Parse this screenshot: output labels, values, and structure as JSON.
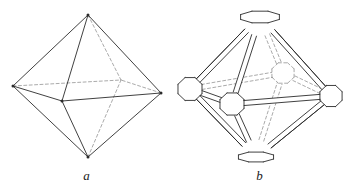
{
  "plate": {
    "background_color": "#ffffff",
    "width": 346,
    "height": 196,
    "subject": "crystal form drawings: octahedron and truncated octahedron"
  },
  "style": {
    "solid_edge_color": "#2b2b2b",
    "hidden_edge_color": "#8d8d8d",
    "face_color": "#ffffff",
    "caption_color": "#1a1a1a"
  },
  "figures": [
    {
      "id": "a",
      "caption": "a",
      "name": "octahedron",
      "description": "simple octahedron wireframe with hidden edges dashed",
      "vertices": {
        "top": [
          88,
          15
        ],
        "bottom": [
          88,
          157
        ],
        "left": [
          13,
          86
        ],
        "right": [
          161,
          93
        ],
        "front": [
          62,
          101
        ],
        "back": [
          121,
          80
        ]
      },
      "solid_edges": [
        [
          "top",
          "left"
        ],
        [
          "top",
          "right"
        ],
        [
          "top",
          "front"
        ],
        [
          "bottom",
          "left"
        ],
        [
          "bottom",
          "right"
        ],
        [
          "bottom",
          "front"
        ],
        [
          "left",
          "front"
        ],
        [
          "right",
          "front"
        ]
      ],
      "hidden_edges": [
        [
          "top",
          "back"
        ],
        [
          "bottom",
          "back"
        ],
        [
          "left",
          "back"
        ],
        [
          "right",
          "back"
        ]
      ],
      "vertex_dots": [
        "top",
        "bottom",
        "left",
        "right",
        "front"
      ]
    },
    {
      "id": "b",
      "caption": "b",
      "name": "truncated octahedron with bevelled edges",
      "description": "octahedron with each vertex replaced by a small octagonal face and each edge bevelled into a narrow strip",
      "poles": {
        "top": [
          260,
          17
        ],
        "bottom": [
          256,
          157
        ],
        "left": [
          190,
          89
        ],
        "right": [
          331,
          96
        ],
        "front": [
          232,
          104
        ],
        "back": [
          283,
          73
        ]
      },
      "octagon_radii": {
        "top": 21,
        "bottom": 19,
        "left": 13,
        "right": 12,
        "front": 13,
        "back": 12
      },
      "bevel_width": 5
    }
  ]
}
